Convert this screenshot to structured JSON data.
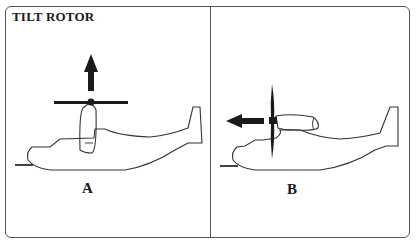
{
  "title": "TILT ROTOR",
  "panels": [
    {
      "label": "A",
      "mode": "vertical-lift",
      "arrow_direction": "up"
    },
    {
      "label": "B",
      "mode": "forward-flight",
      "arrow_direction": "left"
    }
  ],
  "colors": {
    "line": "#333333",
    "fill": "#1a1a1a",
    "background": "#ffffff"
  }
}
